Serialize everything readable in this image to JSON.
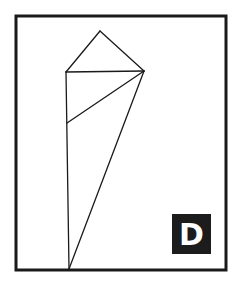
{
  "figure": {
    "label": "D",
    "colors": {
      "frame": "#1a1a1a",
      "lines": "#1a1a1a",
      "label_bg": "#1c1c1c",
      "label_fg": "#ffffff",
      "background": "#ffffff"
    },
    "frame": {
      "x1": 16,
      "y1": 16,
      "x2": 226,
      "y2": 270
    },
    "vertices": {
      "apex_top": [
        100,
        31
      ],
      "left_top": [
        66,
        72
      ],
      "right_top": [
        144,
        71
      ],
      "left_mid": [
        67,
        123
      ],
      "bottom": [
        69,
        269
      ]
    },
    "segments": [
      [
        "apex_top",
        "left_top"
      ],
      [
        "apex_top",
        "right_top"
      ],
      [
        "left_top",
        "right_top"
      ],
      [
        "left_top",
        "bottom"
      ],
      [
        "right_top",
        "left_mid"
      ],
      [
        "right_top",
        "bottom"
      ]
    ]
  }
}
